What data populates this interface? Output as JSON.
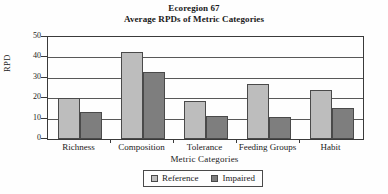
{
  "chart_data": {
    "type": "bar",
    "title": "Ecoregion 67",
    "subtitle": "Average RPDs of Metric Categories",
    "xlabel": "Metric Categories",
    "ylabel": "RPD",
    "categories": [
      "Richness",
      "Composition",
      "Tolerance",
      "Feeding Groups",
      "Habit"
    ],
    "series": [
      {
        "name": "Reference",
        "color": "#bdbdbd",
        "values": [
          20,
          42.5,
          18.5,
          27,
          24
        ]
      },
      {
        "name": "Impaired",
        "color": "#7e7e7e",
        "values": [
          13,
          33,
          11.5,
          11,
          15
        ]
      }
    ],
    "ylim": [
      0,
      50
    ],
    "yticks": [
      50,
      40,
      30,
      20,
      10,
      0
    ],
    "grid": true,
    "legend_position": "bottom"
  },
  "legend": {
    "entries": [
      {
        "label": "Reference"
      },
      {
        "label": "Impaired"
      }
    ]
  }
}
